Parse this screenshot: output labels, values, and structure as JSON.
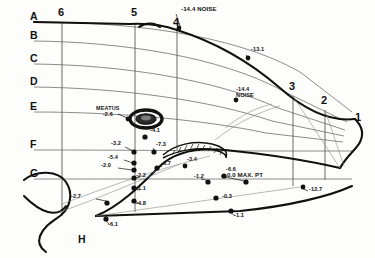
{
  "diagram": {
    "background_color": "#fdfdfc",
    "ink_color": "#111111",
    "grid_color": "#6d6d6d"
  },
  "rows": [
    {
      "label": "A",
      "y": 22
    },
    {
      "label": "B",
      "y": 41
    },
    {
      "label": "C",
      "y": 64
    },
    {
      "label": "D",
      "y": 87
    },
    {
      "label": "E",
      "y": 112
    },
    {
      "label": "F",
      "y": 150
    },
    {
      "label": "G",
      "y": 179
    },
    {
      "label": "H",
      "y": 240
    }
  ],
  "stations": [
    {
      "label": "6",
      "x": 62,
      "y": 14
    },
    {
      "label": "5",
      "x": 135,
      "y": 14
    },
    {
      "label": "4",
      "x": 177,
      "y": 24
    },
    {
      "label": "3",
      "x": 293,
      "y": 88
    },
    {
      "label": "2",
      "x": 325,
      "y": 102
    },
    {
      "label": "1",
      "x": 358,
      "y": 119
    }
  ],
  "annotations": {
    "meatus": {
      "text": "MEATUS\n-2.6",
      "x": 99,
      "y": 108
    },
    "noise_top": {
      "text": "-14.4 NOISE",
      "x": 185,
      "y": 9
    },
    "noise_mid": {
      "text": "-14.4\nNOISE",
      "x": 238,
      "y": 89
    },
    "max_point": {
      "text": "0.0 MAX. PT",
      "x": 231,
      "y": 176
    }
  },
  "points": [
    {
      "value": "-14.4 NOISE",
      "label_x": 185,
      "label_y": 9,
      "dot_x": 179,
      "dot_y": 28,
      "bare": true
    },
    {
      "value": "-13.1",
      "label_x": 253,
      "label_y": 50,
      "dot_x": 248,
      "dot_y": 58
    },
    {
      "value": "-14.4",
      "label_x": 238,
      "label_y": 89,
      "dot_x": 236,
      "dot_y": 100,
      "bare": true
    },
    {
      "value": "-2.6",
      "label_x": 101,
      "label_y": 115,
      "dot_x": 128,
      "dot_y": 119,
      "bare": true
    },
    {
      "value": "-4.1",
      "label_x": 152,
      "label_y": 131,
      "dot_x": 145,
      "dot_y": 137
    },
    {
      "value": "-3.2",
      "label_x": 113,
      "label_y": 144,
      "dot_x": 134,
      "dot_y": 152
    },
    {
      "value": "-7.3",
      "label_x": 158,
      "label_y": 145,
      "dot_x": 154,
      "dot_y": 152
    },
    {
      "value": "-5.4",
      "label_x": 110,
      "label_y": 158,
      "dot_x": 134,
      "dot_y": 163
    },
    {
      "value": "-2.0",
      "label_x": 103,
      "label_y": 166,
      "dot_x": 134,
      "dot_y": 170
    },
    {
      "value": "-6.7",
      "label_x": 163,
      "label_y": 164,
      "dot_x": 157,
      "dot_y": 168
    },
    {
      "value": "-3.4",
      "label_x": 189,
      "label_y": 160,
      "dot_x": 185,
      "dot_y": 166,
      "bare": true
    },
    {
      "value": "-6.6",
      "label_x": 228,
      "label_y": 170,
      "dot_x": 224,
      "dot_y": 176
    },
    {
      "value": "-2.2",
      "label_x": 137,
      "label_y": 176,
      "dot_x": 134,
      "dot_y": 178
    },
    {
      "value": "-1.2",
      "label_x": 196,
      "label_y": 177,
      "dot_x": 208,
      "dot_y": 182
    },
    {
      "value": "0.0 MAX. PT",
      "label_x": 231,
      "label_y": 176,
      "dot_x": 246,
      "dot_y": 182,
      "bare": true
    },
    {
      "value": "-12.7",
      "label_x": 311,
      "label_y": 190,
      "dot_x": 303,
      "dot_y": 187
    },
    {
      "value": "-1.1",
      "label_x": 137,
      "label_y": 189,
      "dot_x": 134,
      "dot_y": 188
    },
    {
      "value": "-2.7",
      "label_x": 73,
      "label_y": 197,
      "dot_x": 107,
      "dot_y": 203
    },
    {
      "value": "-4.8",
      "label_x": 137,
      "label_y": 204,
      "dot_x": 134,
      "dot_y": 201
    },
    {
      "value": "-0.3",
      "label_x": 224,
      "label_y": 197,
      "dot_x": 216,
      "dot_y": 198
    },
    {
      "value": "-6.1",
      "label_x": 110,
      "label_y": 225,
      "dot_x": 106,
      "dot_y": 219
    },
    {
      "value": "-1.1",
      "label_x": 236,
      "label_y": 216,
      "dot_x": 231,
      "dot_y": 211
    }
  ]
}
